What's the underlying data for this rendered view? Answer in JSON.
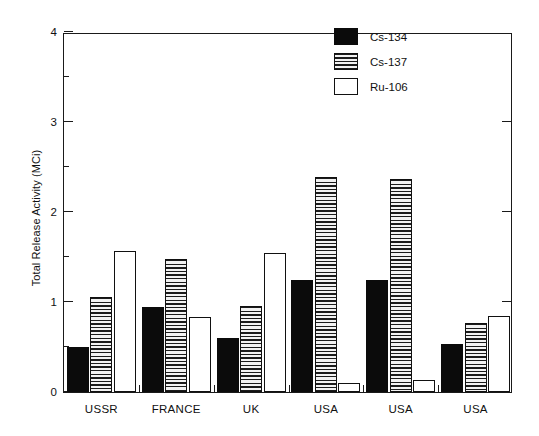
{
  "chart_data": {
    "type": "bar",
    "title": "",
    "xlabel": "",
    "ylabel": "Total Release Activity (MCi)",
    "ylim": [
      0,
      4
    ],
    "yticks": [
      0,
      1,
      2,
      3,
      4
    ],
    "ytick_labels": [
      "0",
      "1",
      "2",
      "3",
      "4"
    ],
    "y_minor_ticks": [
      0.5,
      1.5,
      2.5,
      3.5
    ],
    "grid": false,
    "legend_position": "upper right",
    "categories": [
      "USSR",
      "FRANCE",
      "UK",
      "USA",
      "USA",
      "USA"
    ],
    "series": [
      {
        "name": "Cs-134",
        "fill": "solid",
        "values": [
          0.5,
          0.95,
          0.6,
          1.24,
          1.24,
          0.53
        ]
      },
      {
        "name": "Cs-137",
        "fill": "hatch",
        "values": [
          1.06,
          1.48,
          0.96,
          2.39,
          2.37,
          0.77
        ]
      },
      {
        "name": "Ru-106",
        "fill": "open",
        "values": [
          1.57,
          0.83,
          1.55,
          0.1,
          0.13,
          0.85
        ]
      }
    ]
  },
  "legend": {
    "items": [
      {
        "label": "Cs-134",
        "fill": "solid"
      },
      {
        "label": "Cs-137",
        "fill": "hatch"
      },
      {
        "label": "Ru-106",
        "fill": "open"
      }
    ]
  }
}
